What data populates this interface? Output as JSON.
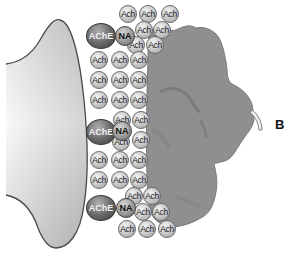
{
  "figure": {
    "panel_label": "B",
    "molecules": {
      "ach_label": "Ach",
      "ache_label": "AChE",
      "na_label": "NA"
    },
    "ache_clusters": [
      {
        "ache": [
          86,
          23
        ],
        "na": [
          115,
          26
        ]
      },
      {
        "ache": [
          86,
          119
        ],
        "na": [
          112,
          121
        ]
      },
      {
        "ache": [
          86,
          195
        ],
        "na": [
          116,
          198
        ]
      }
    ],
    "ach_positions": [
      [
        119,
        5
      ],
      [
        139,
        5
      ],
      [
        161,
        5
      ],
      [
        135,
        21
      ],
      [
        153,
        21
      ],
      [
        127,
        36
      ],
      [
        146,
        36
      ],
      [
        90,
        51
      ],
      [
        111,
        51
      ],
      [
        130,
        51
      ],
      [
        90,
        71
      ],
      [
        111,
        71
      ],
      [
        130,
        71
      ],
      [
        90,
        91
      ],
      [
        111,
        91
      ],
      [
        130,
        91
      ],
      [
        113,
        111
      ],
      [
        132,
        111
      ],
      [
        112,
        133
      ],
      [
        132,
        131
      ],
      [
        90,
        151
      ],
      [
        111,
        151
      ],
      [
        130,
        151
      ],
      [
        90,
        171
      ],
      [
        111,
        171
      ],
      [
        130,
        171
      ],
      [
        125,
        187
      ],
      [
        143,
        187
      ],
      [
        134,
        203
      ],
      [
        152,
        203
      ],
      [
        118,
        220
      ],
      [
        138,
        220
      ],
      [
        158,
        220
      ]
    ],
    "colors": {
      "terminal_edge": "#4a4a4a",
      "receptor_fill": "#8f8f8f",
      "receptor_shade": "#7a7a7a",
      "label_text": "#111111"
    }
  }
}
